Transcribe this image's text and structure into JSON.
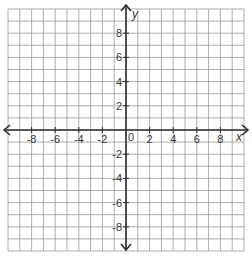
{
  "diagram": {
    "type": "coordinate-plane",
    "x_range": [
      -10,
      10
    ],
    "y_range": [
      -10,
      10
    ],
    "grid_step": 1,
    "label_step": 2,
    "x_axis_label": "x",
    "y_axis_label": "y",
    "origin_label": "0",
    "x_tick_labels": [
      "-8",
      "-6",
      "-4",
      "-2",
      "2",
      "4",
      "6",
      "8"
    ],
    "x_tick_values": [
      -8,
      -6,
      -4,
      -2,
      2,
      4,
      6,
      8
    ],
    "y_tick_labels": [
      "8",
      "6",
      "4",
      "2",
      "-2",
      "-4",
      "-6",
      "-8"
    ],
    "y_tick_values": [
      8,
      6,
      4,
      2,
      -2,
      -4,
      -6,
      -8
    ],
    "colors": {
      "grid": "#9a9a9a",
      "axis": "#2e2e2e",
      "text": "#3a3a3a",
      "background": "#ffffff"
    }
  }
}
